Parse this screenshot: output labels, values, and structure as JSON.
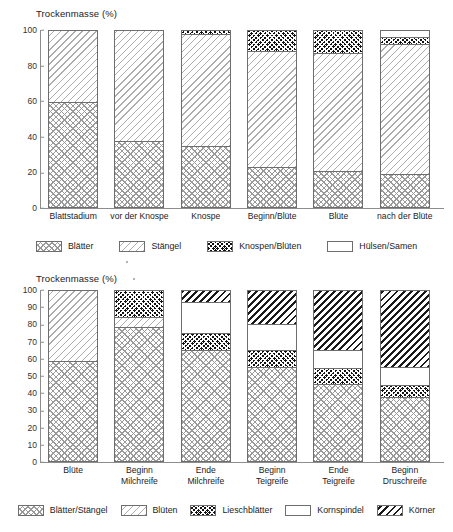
{
  "chart_data": [
    {
      "id": "top",
      "type": "bar",
      "subtype": "stacked-bar-100",
      "title": "Trockenmasse (%)",
      "xlabel": "",
      "ylabel": "Trockenmasse (%)",
      "ylim": [
        0,
        100
      ],
      "yticks": [
        0,
        20,
        40,
        60,
        80,
        100
      ],
      "grid": false,
      "legend_position": "bottom",
      "categories": [
        "Blattstadium",
        "vor der Knospe",
        "Knospe",
        "Beginn/Blüte",
        "Blüte",
        "nach der Blüte"
      ],
      "series": [
        {
          "name": "Blätter",
          "pattern": "p-cross",
          "values": [
            59,
            37,
            34,
            22,
            20,
            18
          ]
        },
        {
          "name": "Stängel",
          "pattern": "p-diag",
          "values": [
            41,
            63,
            64,
            66,
            67,
            74
          ]
        },
        {
          "name": "Knospen/Blüten",
          "pattern": "p-dark",
          "values": [
            0,
            0,
            2,
            12,
            13,
            4
          ]
        },
        {
          "name": "Hülsen/Samen",
          "pattern": "p-white",
          "values": [
            0,
            0,
            0,
            0,
            0,
            4
          ]
        }
      ],
      "legend": [
        "Blätter",
        "Stängel",
        "Knospen/Blüten",
        "Hülsen/Samen"
      ]
    },
    {
      "id": "bottom",
      "type": "bar",
      "subtype": "stacked-bar-100",
      "title": "Trockenmasse (%)",
      "xlabel": "",
      "ylabel": "Trockenmasse (%)",
      "ylim": [
        0,
        100
      ],
      "yticks": [
        0,
        10,
        20,
        30,
        40,
        50,
        60,
        70,
        80,
        90,
        100
      ],
      "grid": false,
      "legend_position": "bottom",
      "categories": [
        "Blüte",
        "Beginn\nMilchreife",
        "Ende\nMilchreife",
        "Beginn\nTeigreife",
        "Ende\nTeigreife",
        "Beginn\nDruschreife"
      ],
      "series": [
        {
          "name": "Blätter/Stängel",
          "pattern": "p-cross",
          "values": [
            58,
            78,
            65,
            55,
            45,
            37
          ]
        },
        {
          "name": "Blüten",
          "pattern": "p-diag",
          "values": [
            42,
            6,
            0,
            0,
            0,
            0
          ]
        },
        {
          "name": "Lieschblätter",
          "pattern": "p-dark",
          "values": [
            0,
            16,
            10,
            10,
            9,
            7
          ]
        },
        {
          "name": "Kornspindel",
          "pattern": "p-white",
          "values": [
            0,
            0,
            18,
            15,
            11,
            11
          ]
        },
        {
          "name": "Körner",
          "pattern": "p-diagbold",
          "values": [
            0,
            0,
            7,
            20,
            35,
            45
          ]
        }
      ],
      "legend": [
        "Blätter/Stängel",
        "Blüten",
        "Lieschblätter",
        "Kornspindel",
        "Körner"
      ]
    }
  ],
  "colors": {
    "axis": "#8d8d8d",
    "bar_outline": "#6e6e6e",
    "text": "#1c1c1c",
    "background": "#ffffff"
  }
}
